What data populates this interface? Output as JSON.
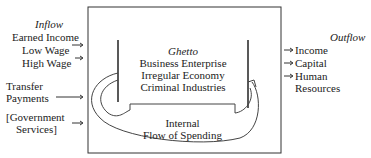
{
  "inflow": {
    "title": "Inflow",
    "earned_income": "Earned Income",
    "low_wage": "Low Wage",
    "high_wage": "High Wage",
    "transfer_line1": "Transfer",
    "transfer_line2": "Payments",
    "gov_line1": "[Government",
    "gov_line2": "Services]"
  },
  "ghetto": {
    "title": "Ghetto",
    "line1": "Business Enterprise",
    "line2": "Irregular Economy",
    "line3": "Criminal Industries"
  },
  "internal": {
    "line1": "Internal",
    "line2": "Flow of Spending"
  },
  "outflow": {
    "title": "Outflow",
    "income": "Income",
    "capital": "Capital",
    "human_line1": "Human",
    "human_line2": "Resources"
  }
}
